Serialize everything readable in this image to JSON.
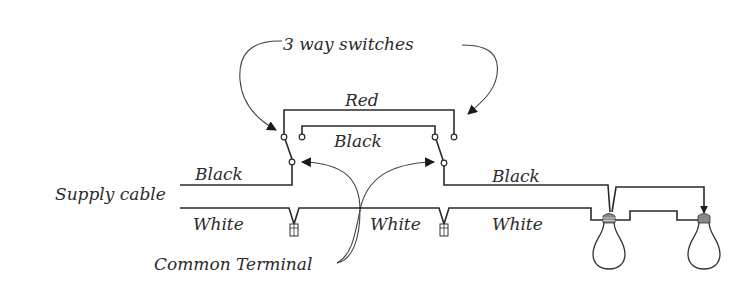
{
  "diagram": {
    "labels": {
      "switches": "3 way switches",
      "red_traveler": "Red",
      "black_traveler": "Black",
      "black_supply": "Black",
      "supply_cable": "Supply cable",
      "white_supply": "White",
      "white_mid": "White",
      "white_lamp": "White",
      "black_lamp": "Black",
      "common_terminal": "Common Terminal"
    },
    "components": {
      "switches": [
        "switch-1",
        "switch-2"
      ],
      "lamps": [
        "lamp-1",
        "lamp-2"
      ],
      "wire_nuts": [
        "wire-nut-1",
        "wire-nut-2"
      ]
    },
    "colors": {
      "wire": "#2a2a2a",
      "background": "#ffffff"
    }
  }
}
